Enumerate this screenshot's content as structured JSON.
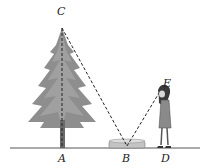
{
  "figure": {
    "labels": {
      "C": "C",
      "A": "A",
      "B": "B",
      "D": "D",
      "E": "E"
    },
    "colors": {
      "tree": "#8a8a8a",
      "tree_dark": "#6e6e6e",
      "line": "#333333",
      "ground": "#555555",
      "mirror": "#b8b8b8"
    }
  }
}
